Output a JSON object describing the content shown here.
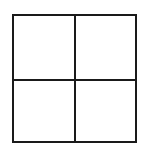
{
  "diagram": {
    "type": "grid",
    "rows": 2,
    "columns": 2,
    "cells": [
      {
        "row": 0,
        "col": 0,
        "label": ""
      },
      {
        "row": 0,
        "col": 1,
        "label": ""
      },
      {
        "row": 1,
        "col": 0,
        "label": ""
      },
      {
        "row": 1,
        "col": 1,
        "label": ""
      }
    ],
    "line_color": "#1a1a1a",
    "background": "#ffffff"
  }
}
